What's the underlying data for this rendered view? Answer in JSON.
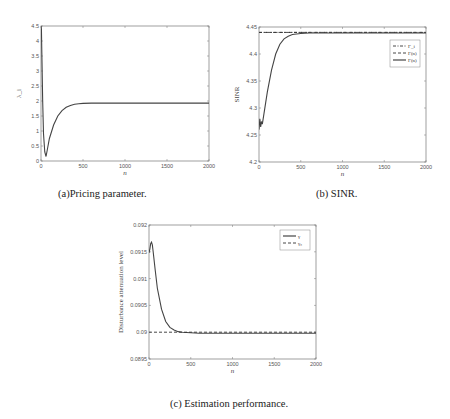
{
  "chart_data": [
    {
      "id": "a",
      "type": "line",
      "caption": "(a)Pricing parameter.",
      "xlabel": "n",
      "ylabel": "λ_i",
      "xlim": [
        0,
        2000
      ],
      "ylim": [
        0,
        4.5
      ],
      "xticks": [
        "0",
        "500",
        "1000",
        "1500",
        "2000"
      ],
      "yticks": [
        "0",
        "0.5",
        "1",
        "1.5",
        "2",
        "2.5",
        "3",
        "3.5",
        "4",
        "4.5"
      ],
      "grid": false,
      "legend": null,
      "series": [
        {
          "name": "λ_i(n)",
          "style": "solid",
          "x": [
            0,
            5,
            10,
            20,
            30,
            45,
            60,
            80,
            100,
            150,
            200,
            250,
            300,
            350,
            400,
            450,
            500,
            600,
            800,
            1000,
            1500,
            2000
          ],
          "y": [
            4.5,
            4.4,
            3.6,
            2.0,
            0.9,
            0.3,
            0.15,
            0.45,
            0.75,
            1.2,
            1.5,
            1.68,
            1.79,
            1.85,
            1.89,
            1.91,
            1.92,
            1.93,
            1.93,
            1.93,
            1.93,
            1.93
          ]
        }
      ]
    },
    {
      "id": "b",
      "type": "line",
      "caption": "(b) SINR.",
      "xlabel": "n",
      "ylabel": "SINR",
      "xlim": [
        0,
        2000
      ],
      "ylim": [
        4.2,
        4.45
      ],
      "xticks": [
        "0",
        "500",
        "1000",
        "1500",
        "2000"
      ],
      "yticks": [
        "4.2",
        "4.25",
        "4.3",
        "4.35",
        "4.4",
        "4.45"
      ],
      "grid": false,
      "legend": {
        "position": "upper right",
        "entries": [
          "Γ_i",
          "Γ(n)",
          "Γ(n)"
        ]
      },
      "series": [
        {
          "name": "Γ_i",
          "style": "dash-dot",
          "x": [
            0,
            2000
          ],
          "y": [
            4.44,
            4.44
          ]
        },
        {
          "name": "Γ(n)",
          "style": "dashed",
          "x": [
            0,
            2000
          ],
          "y": [
            4.44,
            4.44
          ]
        },
        {
          "name": "Γ(n)",
          "style": "solid",
          "x": [
            0,
            10,
            20,
            30,
            40,
            60,
            80,
            100,
            150,
            200,
            250,
            300,
            350,
            400,
            500,
            600,
            800,
            1000,
            1500,
            2000
          ],
          "y": [
            4.26,
            4.28,
            4.265,
            4.275,
            4.27,
            4.29,
            4.31,
            4.33,
            4.37,
            4.4,
            4.418,
            4.428,
            4.433,
            4.436,
            4.438,
            4.439,
            4.439,
            4.439,
            4.439,
            4.439
          ]
        }
      ]
    },
    {
      "id": "c",
      "type": "line",
      "caption": "(c) Estimation performance.",
      "xlabel": "n",
      "ylabel": "Disturbance attenuation level",
      "xlim": [
        0,
        2000
      ],
      "ylim": [
        0.0895,
        0.092
      ],
      "xticks": [
        "0",
        "500",
        "1000",
        "1500",
        "2000"
      ],
      "yticks": [
        "0.0895",
        "0.09",
        "0.0905",
        "0.091",
        "0.0915",
        "0.092"
      ],
      "grid": false,
      "legend": {
        "position": "upper right",
        "entries": [
          "γ",
          "γ₀"
        ]
      },
      "series": [
        {
          "name": "γ",
          "style": "solid",
          "x": [
            0,
            10,
            20,
            30,
            40,
            50,
            75,
            100,
            150,
            200,
            250,
            300,
            350,
            400,
            500,
            600,
            800,
            1000,
            1500,
            2000
          ],
          "y": [
            0.09148,
            0.09155,
            0.09165,
            0.09168,
            0.09163,
            0.0915,
            0.09115,
            0.09082,
            0.09043,
            0.0902,
            0.09009,
            0.09004,
            0.09001,
            0.09,
            0.08999,
            0.08998,
            0.08998,
            0.08998,
            0.08998,
            0.08998
          ]
        },
        {
          "name": "γ₀",
          "style": "dashed",
          "x": [
            0,
            2000
          ],
          "y": [
            0.09,
            0.09
          ]
        }
      ]
    }
  ]
}
